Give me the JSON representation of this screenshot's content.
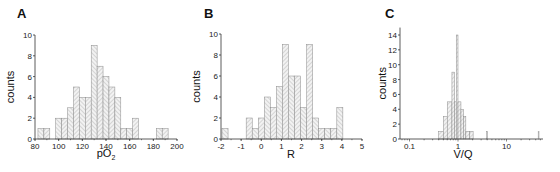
{
  "chart_data": [
    {
      "panel": "A",
      "type": "bar",
      "xlabel": "pO2",
      "ylabel": "counts",
      "xlim": [
        80,
        200
      ],
      "ylim": [
        0,
        10
      ],
      "xticks": [
        80,
        100,
        120,
        140,
        160,
        180,
        200
      ],
      "yticks": [
        0,
        2,
        4,
        6,
        8,
        10
      ],
      "bin_width": 5,
      "bins": [
        {
          "x": 85,
          "count": 1
        },
        {
          "x": 90,
          "count": 1
        },
        {
          "x": 100,
          "count": 2
        },
        {
          "x": 105,
          "count": 2
        },
        {
          "x": 110,
          "count": 3
        },
        {
          "x": 115,
          "count": 5
        },
        {
          "x": 120,
          "count": 4
        },
        {
          "x": 125,
          "count": 4
        },
        {
          "x": 130,
          "count": 9
        },
        {
          "x": 135,
          "count": 7
        },
        {
          "x": 140,
          "count": 6
        },
        {
          "x": 145,
          "count": 5
        },
        {
          "x": 150,
          "count": 4
        },
        {
          "x": 155,
          "count": 1
        },
        {
          "x": 160,
          "count": 1
        },
        {
          "x": 165,
          "count": 2
        },
        {
          "x": 185,
          "count": 1
        },
        {
          "x": 190,
          "count": 1
        }
      ],
      "grid": false
    },
    {
      "panel": "B",
      "type": "bar",
      "xlabel": "R",
      "ylabel": "counts",
      "xlim": [
        -2,
        5
      ],
      "ylim": [
        0,
        10
      ],
      "xticks": [
        -2,
        -1,
        0,
        1,
        2,
        3,
        4,
        5
      ],
      "yticks": [
        0,
        2,
        4,
        6,
        8,
        10
      ],
      "bin_width": 0.3,
      "bins": [
        {
          "x": -1.8,
          "count": 1
        },
        {
          "x": -0.6,
          "count": 2
        },
        {
          "x": -0.3,
          "count": 1
        },
        {
          "x": 0.0,
          "count": 2
        },
        {
          "x": 0.3,
          "count": 4
        },
        {
          "x": 0.6,
          "count": 3
        },
        {
          "x": 0.9,
          "count": 5
        },
        {
          "x": 1.2,
          "count": 9
        },
        {
          "x": 1.5,
          "count": 6
        },
        {
          "x": 1.8,
          "count": 6
        },
        {
          "x": 2.1,
          "count": 3
        },
        {
          "x": 2.4,
          "count": 9
        },
        {
          "x": 2.7,
          "count": 2
        },
        {
          "x": 3.0,
          "count": 1
        },
        {
          "x": 3.3,
          "count": 1
        },
        {
          "x": 3.6,
          "count": 1
        },
        {
          "x": 3.9,
          "count": 3
        }
      ],
      "grid": false
    },
    {
      "panel": "C",
      "type": "bar",
      "xlabel": "V/Q",
      "ylabel": "counts",
      "xscale": "log",
      "xlim": [
        0.06,
        50
      ],
      "ylim": [
        0,
        15
      ],
      "xticks": [
        "0.1",
        "1",
        "10"
      ],
      "yticks": [
        0,
        2,
        4,
        6,
        8,
        10,
        12,
        14
      ],
      "bins": [
        {
          "x0": 0.4,
          "x1": 0.5,
          "count": 1
        },
        {
          "x0": 0.5,
          "x1": 0.6,
          "count": 3
        },
        {
          "x0": 0.6,
          "x1": 0.75,
          "count": 5
        },
        {
          "x0": 0.75,
          "x1": 0.85,
          "count": 9
        },
        {
          "x0": 0.85,
          "x1": 0.92,
          "count": 5
        },
        {
          "x0": 0.92,
          "x1": 1.0,
          "count": 14
        },
        {
          "x0": 1.0,
          "x1": 1.15,
          "count": 5
        },
        {
          "x0": 1.15,
          "x1": 1.3,
          "count": 4
        },
        {
          "x0": 1.3,
          "x1": 1.45,
          "count": 3
        },
        {
          "x0": 1.45,
          "x1": 1.75,
          "count": 1
        },
        {
          "x0": 1.75,
          "x1": 2.05,
          "count": 1
        },
        {
          "x0": 3.9,
          "x1": 4.0,
          "count": 1
        },
        {
          "x0": 45.0,
          "x1": 46.0,
          "count": 1
        }
      ],
      "grid": false
    }
  ],
  "panels": {
    "A": {
      "letter": "A",
      "ylabel": "counts",
      "xlabel_main": "pO",
      "xlabel_sub": "2"
    },
    "B": {
      "letter": "B",
      "ylabel": "counts",
      "xlabel": "R"
    },
    "C": {
      "letter": "C",
      "ylabel": "counts",
      "xlabel": "V/Q"
    }
  }
}
